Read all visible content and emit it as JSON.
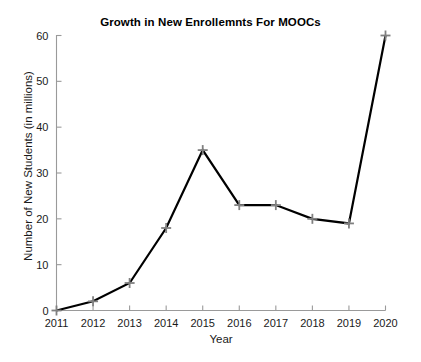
{
  "chart_data": {
    "type": "line",
    "title": "Growth in New Enrollemnts For MOOCs",
    "xlabel": "Year",
    "ylabel": "Number of New Students (in millions)",
    "categories": [
      "2011",
      "2012",
      "2013",
      "2014",
      "2015",
      "2016",
      "2017",
      "2018",
      "2019",
      "2020"
    ],
    "x": [
      2011,
      2012,
      2013,
      2014,
      2015,
      2016,
      2017,
      2018,
      2019,
      2020
    ],
    "values": [
      0,
      2,
      6,
      18,
      35,
      23,
      23,
      20,
      19,
      60
    ],
    "series": [
      {
        "name": "New Students",
        "values": [
          0,
          2,
          6,
          18,
          35,
          23,
          23,
          20,
          19,
          60
        ]
      }
    ],
    "xlim": [
      2011,
      2020
    ],
    "ylim": [
      0,
      60
    ],
    "ytick_labels": [
      "0",
      "10",
      "20",
      "30",
      "40",
      "50",
      "60"
    ],
    "yticks": [
      0,
      10,
      20,
      30,
      40,
      50,
      60
    ],
    "xtick_labels": [
      "2011",
      "2012",
      "2013",
      "2014",
      "2015",
      "2016",
      "2017",
      "2018",
      "2019",
      "2020"
    ],
    "grid": false,
    "legend": false,
    "line_color": "#000000",
    "marker": "plus",
    "marker_color": "#808080",
    "axis_color": "#9a9a9a",
    "background_color": "#ffffff"
  }
}
